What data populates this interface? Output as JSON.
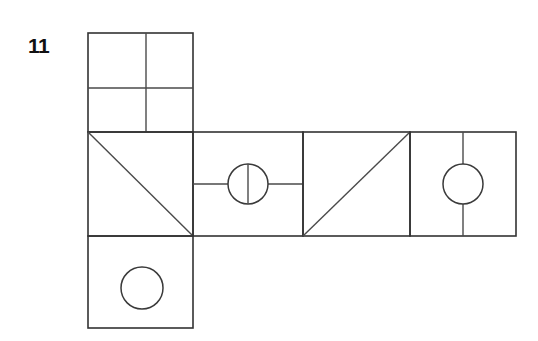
{
  "figure": {
    "problem_number": "11",
    "kind": "cube-net-diagram",
    "stroke_color": "#333333",
    "background_color": "#ffffff",
    "canvas": {
      "width": 538,
      "height": 341
    },
    "geometry": {
      "cell": {
        "width": 105,
        "height": 99
      },
      "columns_x": [
        88,
        193,
        303,
        410,
        516
      ],
      "rows_y": [
        33,
        132,
        236,
        328
      ]
    },
    "faces": [
      {
        "id": "face-top",
        "name": "top-face-quadrants",
        "position": "top",
        "rect": {
          "x": 88,
          "y": 33,
          "w": 105,
          "h": 99
        },
        "markings": "four-quadrants",
        "divider_x": 146,
        "divider_y": 88
      },
      {
        "id": "face-middle-1",
        "name": "middle-face-diagonal-down",
        "position": "middle-1",
        "rect": {
          "x": 88,
          "y": 132,
          "w": 105,
          "h": 104
        },
        "markings": "diagonal-top-left-to-bottom-right"
      },
      {
        "id": "face-middle-2",
        "name": "middle-face-circle-split",
        "position": "middle-2",
        "rect": {
          "x": 193,
          "y": 132,
          "w": 110,
          "h": 104
        },
        "markings": "horizontal-line-with-split-circle",
        "line_y": 184,
        "circle": {
          "cx": 248,
          "cy": 184,
          "r": 20
        }
      },
      {
        "id": "face-middle-3",
        "name": "middle-face-diagonal-up",
        "position": "middle-3",
        "rect": {
          "x": 303,
          "y": 132,
          "w": 107,
          "h": 104
        },
        "markings": "diagonal-bottom-left-to-top-right"
      },
      {
        "id": "face-middle-4",
        "name": "middle-face-circle-on-line",
        "position": "middle-4",
        "rect": {
          "x": 410,
          "y": 132,
          "w": 106,
          "h": 104
        },
        "markings": "vertical-line-with-circle",
        "line_x": 463,
        "circle": {
          "cx": 463,
          "cy": 184,
          "r": 20
        }
      },
      {
        "id": "face-bottom",
        "name": "bottom-face-circle",
        "position": "bottom",
        "rect": {
          "x": 88,
          "y": 236,
          "w": 105,
          "h": 92
        },
        "markings": "plain-circle",
        "circle": {
          "cx": 142,
          "cy": 288,
          "r": 21
        }
      }
    ]
  }
}
